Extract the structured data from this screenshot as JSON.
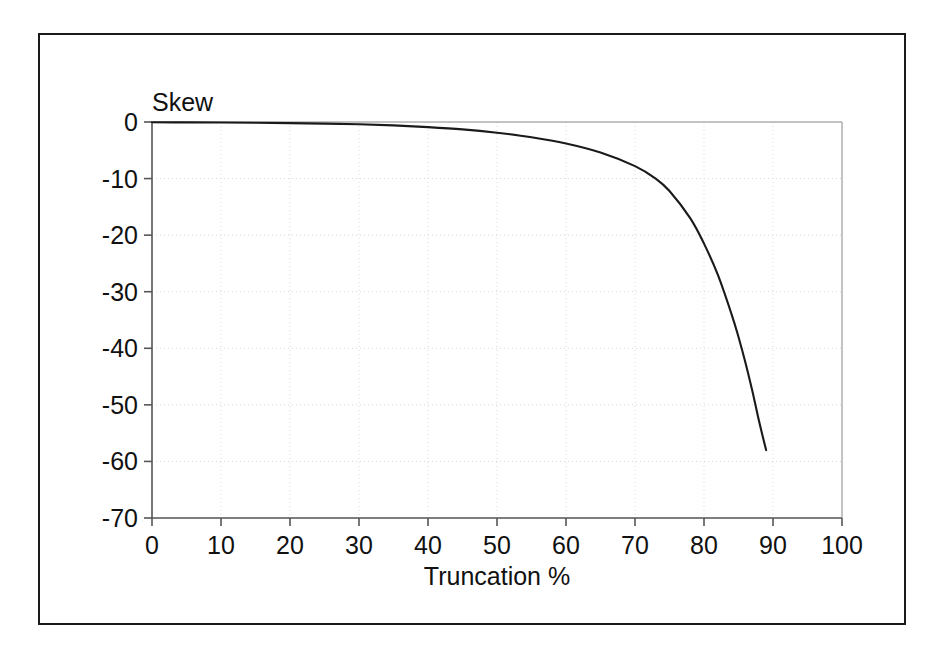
{
  "chart_data": {
    "type": "line",
    "title": "",
    "xlabel": "Truncation %",
    "ylabel": "Skew",
    "xlim": [
      0,
      100
    ],
    "ylim": [
      -70,
      0
    ],
    "xticks": [
      0,
      10,
      20,
      30,
      40,
      50,
      60,
      70,
      80,
      90,
      100
    ],
    "yticks": [
      0,
      -10,
      -20,
      -30,
      -40,
      -50,
      -60,
      -70
    ],
    "xtick_labels": [
      "0",
      "10",
      "20",
      "30",
      "40",
      "50",
      "60",
      "70",
      "80",
      "90",
      "100"
    ],
    "ytick_labels": [
      "0",
      "-10",
      "-20",
      "-30",
      "-40",
      "-50",
      "-60",
      "-70"
    ],
    "grid": true,
    "grid_style": "dotted-faint",
    "legend": null,
    "line_color": "#1a1a1a",
    "series": [
      {
        "name": "Skew",
        "x": [
          0,
          5,
          10,
          15,
          20,
          25,
          30,
          35,
          40,
          45,
          50,
          55,
          60,
          65,
          70,
          73,
          75,
          78,
          80,
          82,
          84,
          85,
          86,
          87,
          88,
          89
        ],
        "y": [
          -0.05,
          -0.07,
          -0.1,
          -0.14,
          -0.2,
          -0.28,
          -0.4,
          -0.6,
          -0.9,
          -1.3,
          -1.9,
          -2.7,
          -3.8,
          -5.4,
          -7.8,
          -10.0,
          -12.2,
          -17.0,
          -21.5,
          -27.0,
          -34.0,
          -38.0,
          -42.5,
          -47.5,
          -53.0,
          -58.0
        ]
      }
    ]
  },
  "axis_titles": {
    "y": "Skew",
    "x": "Truncation %"
  }
}
